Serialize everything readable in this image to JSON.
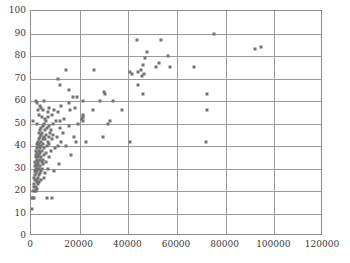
{
  "chart_data": {
    "type": "scatter",
    "title": "",
    "xlabel": "",
    "ylabel": "",
    "xlim": [
      0,
      120000
    ],
    "ylim": [
      0,
      100
    ],
    "xticks": [
      0,
      20000,
      40000,
      60000,
      80000,
      100000,
      120000
    ],
    "yticks": [
      0,
      10,
      20,
      30,
      40,
      50,
      60,
      70,
      80,
      90,
      100
    ],
    "xtick_labels": [
      "0",
      "20000",
      "40000",
      "60000",
      "80000",
      "100000",
      "120000"
    ],
    "ytick_labels": [
      "0",
      "10",
      "20",
      "30",
      "40",
      "50",
      "60",
      "70",
      "80",
      "90",
      "100"
    ],
    "grid": true,
    "legend": null,
    "marker_color": "#737373",
    "grid_color": "#9a9a9a",
    "frame_color": "#8c8c8c",
    "background": "#ffffff",
    "points": [
      [
        400,
        12
      ],
      [
        500,
        17
      ],
      [
        900,
        17
      ],
      [
        1200,
        17
      ],
      [
        6500,
        17
      ],
      [
        8500,
        17
      ],
      [
        1000,
        20
      ],
      [
        1500,
        20
      ],
      [
        2200,
        20
      ],
      [
        2600,
        21
      ],
      [
        1300,
        22
      ],
      [
        2000,
        22
      ],
      [
        3000,
        23
      ],
      [
        1200,
        23
      ],
      [
        2400,
        24
      ],
      [
        3400,
        24
      ],
      [
        1800,
        25
      ],
      [
        2600,
        25
      ],
      [
        4200,
        25
      ],
      [
        1400,
        26
      ],
      [
        2900,
        26
      ],
      [
        5200,
        26
      ],
      [
        1700,
        27
      ],
      [
        3100,
        27
      ],
      [
        2100,
        28
      ],
      [
        3600,
        28
      ],
      [
        5600,
        28
      ],
      [
        1500,
        29
      ],
      [
        2500,
        29
      ],
      [
        4000,
        29
      ],
      [
        9500,
        29
      ],
      [
        2000,
        30
      ],
      [
        2800,
        30
      ],
      [
        3400,
        30
      ],
      [
        4600,
        30
      ],
      [
        6800,
        30
      ],
      [
        1600,
        31
      ],
      [
        2400,
        31
      ],
      [
        3800,
        31
      ],
      [
        2100,
        32
      ],
      [
        3000,
        32
      ],
      [
        5100,
        32
      ],
      [
        11500,
        32
      ],
      [
        1800,
        33
      ],
      [
        2700,
        33
      ],
      [
        4400,
        33
      ],
      [
        6200,
        33
      ],
      [
        2300,
        34
      ],
      [
        3500,
        34
      ],
      [
        5000,
        34
      ],
      [
        1900,
        35
      ],
      [
        2900,
        35
      ],
      [
        4100,
        35
      ],
      [
        7300,
        35
      ],
      [
        2200,
        36
      ],
      [
        3300,
        36
      ],
      [
        5400,
        36
      ],
      [
        16500,
        36
      ],
      [
        2600,
        37
      ],
      [
        3900,
        37
      ],
      [
        6100,
        37
      ],
      [
        2000,
        38
      ],
      [
        3100,
        38
      ],
      [
        4700,
        38
      ],
      [
        8200,
        38
      ],
      [
        2400,
        39
      ],
      [
        3600,
        39
      ],
      [
        5300,
        39
      ],
      [
        9800,
        39
      ],
      [
        2800,
        40
      ],
      [
        4200,
        40
      ],
      [
        6400,
        40
      ],
      [
        11000,
        40
      ],
      [
        14500,
        40
      ],
      [
        2300,
        41
      ],
      [
        3400,
        41
      ],
      [
        5000,
        41
      ],
      [
        7600,
        41
      ],
      [
        2700,
        42
      ],
      [
        4100,
        42
      ],
      [
        6900,
        42
      ],
      [
        12500,
        42
      ],
      [
        18500,
        42
      ],
      [
        22500,
        42
      ],
      [
        40500,
        42
      ],
      [
        72000,
        42
      ],
      [
        3200,
        43
      ],
      [
        4800,
        43
      ],
      [
        5900,
        43
      ],
      [
        8800,
        43
      ],
      [
        3600,
        44
      ],
      [
        5400,
        44
      ],
      [
        7200,
        44
      ],
      [
        10500,
        44
      ],
      [
        17500,
        44
      ],
      [
        29500,
        44
      ],
      [
        4000,
        45
      ],
      [
        6000,
        45
      ],
      [
        9200,
        45
      ],
      [
        3300,
        46
      ],
      [
        4600,
        46
      ],
      [
        7800,
        46
      ],
      [
        13000,
        46
      ],
      [
        3800,
        47
      ],
      [
        5600,
        47
      ],
      [
        8400,
        47
      ],
      [
        4300,
        48
      ],
      [
        6600,
        48
      ],
      [
        11800,
        48
      ],
      [
        4900,
        49
      ],
      [
        7400,
        49
      ],
      [
        15500,
        49
      ],
      [
        2400,
        50
      ],
      [
        5200,
        50
      ],
      [
        9000,
        50
      ],
      [
        19500,
        50
      ],
      [
        31500,
        50
      ],
      [
        1000,
        51
      ],
      [
        6200,
        51
      ],
      [
        10200,
        51
      ],
      [
        21500,
        51
      ],
      [
        32500,
        51
      ],
      [
        12000,
        51
      ],
      [
        5800,
        52
      ],
      [
        13500,
        52
      ],
      [
        21000,
        52
      ],
      [
        4500,
        53
      ],
      [
        7000,
        53
      ],
      [
        21200,
        53
      ],
      [
        3200,
        54
      ],
      [
        8600,
        54
      ],
      [
        21300,
        54
      ],
      [
        6800,
        55
      ],
      [
        11000,
        55
      ],
      [
        2800,
        56
      ],
      [
        5000,
        56
      ],
      [
        9500,
        56
      ],
      [
        16000,
        56
      ],
      [
        25500,
        56
      ],
      [
        37500,
        56
      ],
      [
        72500,
        56
      ],
      [
        4200,
        57
      ],
      [
        7600,
        57
      ],
      [
        18000,
        57
      ],
      [
        3500,
        58
      ],
      [
        12500,
        58
      ],
      [
        2500,
        59
      ],
      [
        15800,
        59
      ],
      [
        2000,
        60
      ],
      [
        5500,
        60
      ],
      [
        21500,
        60
      ],
      [
        28500,
        60
      ],
      [
        33500,
        60
      ],
      [
        17200,
        62
      ],
      [
        18800,
        62
      ],
      [
        30500,
        63
      ],
      [
        46000,
        63
      ],
      [
        72500,
        63
      ],
      [
        30000,
        64
      ],
      [
        15500,
        65
      ],
      [
        44000,
        67
      ],
      [
        12000,
        67
      ],
      [
        11000,
        70
      ],
      [
        45500,
        71
      ],
      [
        46500,
        72
      ],
      [
        41500,
        72
      ],
      [
        40500,
        73
      ],
      [
        44000,
        73
      ],
      [
        45000,
        74
      ],
      [
        14500,
        74
      ],
      [
        26000,
        74
      ],
      [
        51500,
        75
      ],
      [
        57000,
        75
      ],
      [
        67000,
        75
      ],
      [
        46000,
        76
      ],
      [
        52500,
        77
      ],
      [
        46800,
        79
      ],
      [
        56500,
        80
      ],
      [
        47500,
        82
      ],
      [
        92000,
        83
      ],
      [
        94500,
        84
      ],
      [
        43500,
        87
      ],
      [
        53500,
        87
      ],
      [
        75000,
        90
      ]
    ]
  },
  "axes": {
    "y_title": "",
    "x_title": ""
  }
}
